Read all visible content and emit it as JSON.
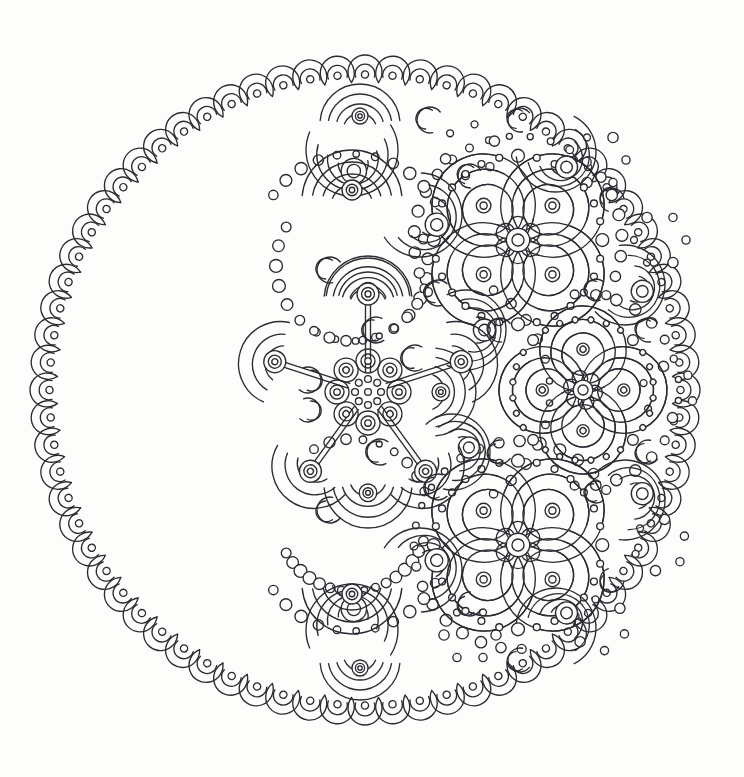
{
  "artwork": {
    "title": "Crescent Moon Mandala Coloring Page",
    "type": "line-art-mandala",
    "style": "black-and-white outline illustration",
    "background_color": "#fdfdfb",
    "ink_color": "#2b2b33",
    "canvas": {
      "width": 744,
      "height": 777
    }
  },
  "composition": {
    "outer_circle": {
      "cx": 365,
      "cy": 390,
      "radius": 333
    },
    "description": "A large circular mandala whose left portion is empty white space and whose right portion is densely filled with crescent, flower and dot motifs, giving the impression of a waxing moon.",
    "empty_region_label": "blank crescent of the moon",
    "filled_region_label": "ornamented lit side of the moon"
  },
  "border": {
    "name": "scalloped crescent ring",
    "motif": "crescent-with-dot",
    "count": 72,
    "radius": 318,
    "motif_radius": 17,
    "inner_arc_ratio": 0.58,
    "dot_radius": 3.6,
    "orientation": "each crescent opens toward the mandala centre"
  },
  "center_hub": {
    "name": "star-rosette hub",
    "cx": 368,
    "cy": 392,
    "core_ring_dots": 8,
    "core_ring_radius": 13,
    "core_dot_radius": 3.4,
    "core_center_dot_radius": 3.4,
    "petal_ring_count": 8,
    "petal_ring_radius": 31,
    "petal_outer_radius": 12,
    "petal_inner_radius": 7,
    "petal_dot_radius": 3.2,
    "spokes": 4,
    "spoke_angles_deg": [
      -90,
      -18,
      54,
      126,
      198
    ],
    "spoke_length": 92,
    "spoke_width": 5
  },
  "spoke_caps": {
    "name": "mushroom cap terminal",
    "description": "Each spoke terminates in a layered half-dome of nested arcs topped by concentric circles",
    "arc_layers": 3,
    "cap_radii": [
      42,
      30,
      19
    ],
    "bead_radii": [
      11,
      6.5,
      3
    ]
  },
  "motifs": [
    {
      "id": "four-petal-flower",
      "label": "four petal flower with dotted halo",
      "description": "Four comma-shaped spiral petals around a central six-lobed rosette, encircled by a ring of alternating large and small dots",
      "petals": 4,
      "petal_inner_rings": 3,
      "halo_dots": 28,
      "instances": [
        {
          "cx": 518,
          "cy": 240,
          "r": 86,
          "rot": 0
        },
        {
          "cx": 583,
          "cy": 390,
          "r": 72,
          "rot": 45
        },
        {
          "cx": 518,
          "cy": 545,
          "r": 86,
          "rot": 0
        }
      ]
    },
    {
      "id": "crescent-fan",
      "label": "nested crescent fan",
      "description": "Three or four nested crescent arcs fanning out from a small bead",
      "instances": [
        {
          "cx": 466,
          "cy": 330,
          "r": 40,
          "rot": 180
        },
        {
          "cx": 452,
          "cy": 452,
          "r": 38,
          "rot": 165
        },
        {
          "cx": 625,
          "cy": 285,
          "r": 40,
          "rot": 200
        },
        {
          "cx": 625,
          "cy": 500,
          "r": 40,
          "rot": 160
        },
        {
          "cx": 420,
          "cy": 215,
          "r": 42,
          "rot": 210
        },
        {
          "cx": 420,
          "cy": 570,
          "r": 42,
          "rot": 150
        },
        {
          "cx": 352,
          "cy": 150,
          "r": 46,
          "rot": 265
        },
        {
          "cx": 352,
          "cy": 630,
          "r": 46,
          "rot": 95
        },
        {
          "cx": 556,
          "cy": 152,
          "r": 40,
          "rot": 235
        },
        {
          "cx": 556,
          "cy": 628,
          "r": 40,
          "rot": 125
        }
      ]
    },
    {
      "id": "small-crescent",
      "label": "single small crescent",
      "description": "Lone C-shaped crescent sprinkled as filler between larger motifs",
      "instances": [
        {
          "cx": 430,
          "cy": 120,
          "r": 13,
          "rot": 20
        },
        {
          "cx": 415,
          "cy": 358,
          "r": 13,
          "rot": 0
        },
        {
          "cx": 308,
          "cy": 380,
          "r": 13,
          "rot": 190
        },
        {
          "cx": 308,
          "cy": 410,
          "r": 12,
          "rot": 190
        },
        {
          "cx": 376,
          "cy": 330,
          "r": 13,
          "rot": 355
        },
        {
          "cx": 380,
          "cy": 452,
          "r": 13,
          "rot": 5
        },
        {
          "cx": 438,
          "cy": 293,
          "r": 13,
          "rot": 12
        },
        {
          "cx": 438,
          "cy": 487,
          "r": 13,
          "rot": 348
        },
        {
          "cx": 500,
          "cy": 330,
          "r": 12,
          "rot": 25
        },
        {
          "cx": 500,
          "cy": 452,
          "r": 12,
          "rot": 335
        },
        {
          "cx": 330,
          "cy": 510,
          "r": 13,
          "rot": 340
        },
        {
          "cx": 330,
          "cy": 270,
          "r": 13,
          "rot": 20
        },
        {
          "cx": 470,
          "cy": 176,
          "r": 12,
          "rot": 30
        },
        {
          "cx": 470,
          "cy": 604,
          "r": 12,
          "rot": 330
        },
        {
          "cx": 612,
          "cy": 200,
          "r": 12,
          "rot": 50
        },
        {
          "cx": 612,
          "cy": 580,
          "r": 12,
          "rot": 310
        },
        {
          "cx": 648,
          "cy": 330,
          "r": 12,
          "rot": 20
        },
        {
          "cx": 648,
          "cy": 452,
          "r": 12,
          "rot": 340
        },
        {
          "cx": 596,
          "cy": 290,
          "r": 11,
          "rot": 10
        },
        {
          "cx": 596,
          "cy": 492,
          "r": 11,
          "rot": 350
        },
        {
          "cx": 520,
          "cy": 660,
          "r": 12,
          "rot": 340
        },
        {
          "cx": 520,
          "cy": 120,
          "r": 12,
          "rot": 20
        }
      ]
    },
    {
      "id": "dome-rosette",
      "label": "layered dome with bead stack",
      "description": "Half-dome of nested arcs with a stack of concentric beads at its crown, appearing at the ends of the hub spokes and in the upper and lower lobes",
      "instances": [
        {
          "cx": 368,
          "cy": 300,
          "r": 44,
          "rot": 0
        },
        {
          "cx": 368,
          "cy": 484,
          "r": 44,
          "rot": 180
        },
        {
          "cx": 352,
          "cy": 200,
          "r": 50,
          "rot": 0
        },
        {
          "cx": 352,
          "cy": 584,
          "r": 50,
          "rot": 180
        },
        {
          "cx": 432,
          "cy": 392,
          "r": 44,
          "rot": 90
        },
        {
          "cx": 360,
          "cy": 660,
          "r": 40,
          "rot": 180
        },
        {
          "cx": 360,
          "cy": 124,
          "r": 40,
          "rot": 0
        }
      ]
    },
    {
      "id": "dot-arc",
      "label": "arc of beads",
      "description": "Strings of small open circles tracing the curved boundaries between motif clusters"
    }
  ],
  "palette": {
    "paper": "#fdfdfb",
    "ink": "#2b2b33",
    "fill": "#ffffff"
  }
}
